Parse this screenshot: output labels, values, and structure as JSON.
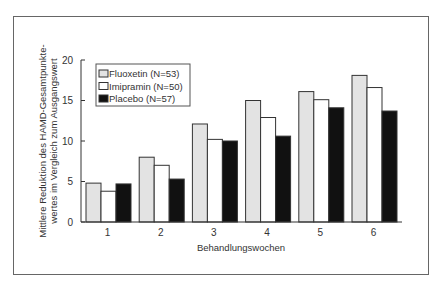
{
  "chart_data": {
    "type": "bar",
    "title": "",
    "xlabel": "Behandlungswochen",
    "ylabel_lines": [
      "Mittlere Reduktion des HAMD-Gesamtpunkte-",
      "wertes im Vergleich zum Ausgangswert"
    ],
    "ylabel": "Mittlere Reduktion des HAMD-Gesamtpunktewertes im Vergleich zum Ausgangswert",
    "categories": [
      "1",
      "2",
      "3",
      "4",
      "5",
      "6"
    ],
    "ylim": [
      0,
      20
    ],
    "yticks": [
      0,
      5,
      10,
      15,
      20
    ],
    "grid": false,
    "legend_position": "upper-left inside",
    "series": [
      {
        "name": "Fluoxetin (N=53)",
        "color": "#e3e3e3",
        "values": [
          4.8,
          8.0,
          12.1,
          15.0,
          16.1,
          18.1
        ]
      },
      {
        "name": "Imipramin (N=50)",
        "color": "#ffffff",
        "values": [
          3.8,
          7.0,
          10.2,
          12.9,
          15.1,
          16.6
        ]
      },
      {
        "name": "Placebo (N=57)",
        "color": "#111111",
        "values": [
          4.7,
          5.3,
          10.0,
          10.6,
          14.1,
          13.7
        ]
      }
    ]
  }
}
